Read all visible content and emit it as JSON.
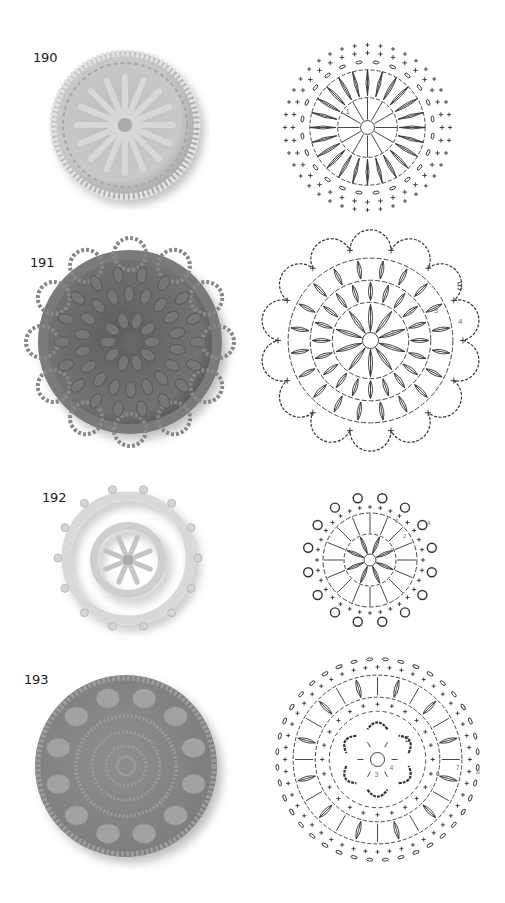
{
  "page": {
    "motifs": [
      {
        "number": "190",
        "photo": {
          "description": "crochet-motif-photo",
          "yarn_color": "#c8c8c8",
          "pattern": "spoke puff stitches with chain lattice and single-crochet border"
        },
        "chart": {
          "round_labels": [
            "1",
            "2",
            "3",
            "4",
            "5"
          ],
          "marker": "start-marker"
        }
      },
      {
        "number": "191",
        "photo": {
          "description": "crochet-motif-photo",
          "yarn_color": "#6e6e6e",
          "pattern": "concentric rings of puff stitches with scalloped chain edge"
        },
        "chart": {
          "round_labels": [
            "1",
            "2",
            "3",
            "4",
            "5"
          ]
        }
      },
      {
        "number": "192",
        "photo": {
          "description": "crochet-motif-photo",
          "yarn_color": "#d6d6d6",
          "pattern": "small puff flower center with double ring and picot edge"
        },
        "chart": {
          "round_labels": [
            "1",
            "2",
            "3",
            "4"
          ]
        }
      },
      {
        "number": "193",
        "photo": {
          "description": "crochet-motif-photo",
          "yarn_color": "#8a8a8a",
          "pattern": "spiral center with ring of puff stitches and single-crochet border"
        },
        "chart": {
          "round_labels": [
            "3",
            "4",
            "5",
            "6",
            "7",
            "8"
          ]
        }
      }
    ]
  }
}
